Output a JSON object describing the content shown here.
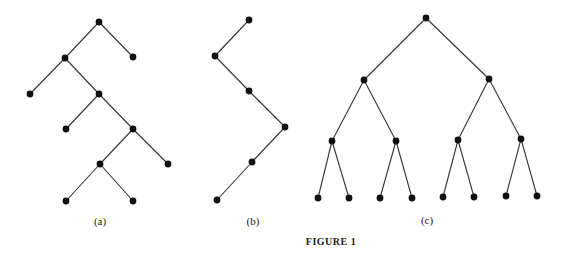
{
  "figure": {
    "caption": "FIGURE 1",
    "caption_pos": [
      331,
      245
    ],
    "panels": [
      {
        "label": "(a)",
        "label_pos": [
          100,
          225
        ],
        "nodes": [
          [
            99,
            22
          ],
          [
            65,
            58
          ],
          [
            133,
            57
          ],
          [
            30,
            94
          ],
          [
            99,
            94
          ],
          [
            66,
            129
          ],
          [
            133,
            129
          ],
          [
            100,
            164
          ],
          [
            168,
            164
          ],
          [
            66,
            201
          ],
          [
            133,
            201
          ]
        ],
        "edges": [
          [
            0,
            1
          ],
          [
            0,
            2
          ],
          [
            1,
            3
          ],
          [
            1,
            4
          ],
          [
            4,
            5
          ],
          [
            4,
            6
          ],
          [
            6,
            7
          ],
          [
            6,
            8
          ],
          [
            7,
            9
          ],
          [
            7,
            10
          ]
        ]
      },
      {
        "label": "(b)",
        "label_pos": [
          253,
          225
        ],
        "nodes": [
          [
            249,
            20
          ],
          [
            215,
            56
          ],
          [
            249,
            91
          ],
          [
            285,
            127
          ],
          [
            252,
            162
          ],
          [
            217,
            200
          ]
        ],
        "edges": [
          [
            0,
            1
          ],
          [
            1,
            2
          ],
          [
            2,
            3
          ],
          [
            3,
            4
          ],
          [
            4,
            5
          ]
        ]
      },
      {
        "label": "(c)",
        "label_pos": [
          427,
          224
        ],
        "nodes": [
          [
            426,
            18
          ],
          [
            364,
            80
          ],
          [
            489,
            79
          ],
          [
            332,
            141
          ],
          [
            396,
            141
          ],
          [
            458,
            140
          ],
          [
            521,
            139
          ],
          [
            318,
            198
          ],
          [
            349,
            198
          ],
          [
            380,
            198
          ],
          [
            412,
            198
          ],
          [
            443,
            197
          ],
          [
            474,
            197
          ],
          [
            506,
            196
          ],
          [
            537,
            196
          ]
        ],
        "edges": [
          [
            0,
            1
          ],
          [
            0,
            2
          ],
          [
            1,
            3
          ],
          [
            1,
            4
          ],
          [
            2,
            5
          ],
          [
            2,
            6
          ],
          [
            3,
            7
          ],
          [
            3,
            8
          ],
          [
            4,
            9
          ],
          [
            4,
            10
          ],
          [
            5,
            11
          ],
          [
            5,
            12
          ],
          [
            6,
            13
          ],
          [
            6,
            14
          ]
        ]
      }
    ]
  }
}
